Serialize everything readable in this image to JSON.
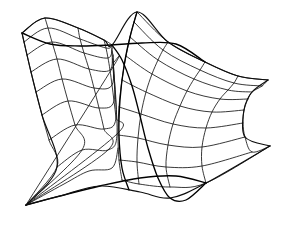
{
  "figure": {
    "title": "Self-intersecting ruled surface wireframe",
    "kind": "line-drawing",
    "background_color": "#ffffff",
    "line_color": "#151515",
    "width": 283,
    "height": 227
  },
  "chart_data": {
    "type": "line",
    "title": "Self-intersecting ruled surface wireframe",
    "xlabel": "",
    "ylabel": "",
    "grid": false,
    "legend": "none",
    "xlim": [
      0,
      283
    ],
    "ylim": [
      0,
      227
    ],
    "key_points": {
      "left_cone_apex": [
        26,
        205
      ],
      "left_top_corner": [
        22,
        33
      ],
      "left_top_ridge": [
        45,
        18
      ],
      "central_node": [
        112,
        45
      ],
      "central_peak": [
        137,
        12
      ],
      "right_upper_tip": [
        268,
        80
      ],
      "right_waist_upper": [
        248,
        90
      ],
      "right_waist_lower": [
        245,
        118
      ],
      "right_lower_tip": [
        270,
        146
      ],
      "bottom_fold_tail": [
        249,
        160
      ]
    },
    "series": [
      {
        "name": "left-sheet-u-curves",
        "values": [
          [
            [
              22,
              33
            ],
            [
              45,
              18
            ],
            [
              78,
              28
            ],
            [
              104,
              40
            ],
            [
              112,
              45
            ]
          ],
          [
            [
              24,
              42
            ],
            [
              48,
              28
            ],
            [
              80,
              39
            ],
            [
              106,
              48
            ],
            [
              112,
              46
            ]
          ],
          [
            [
              27,
              55
            ],
            [
              52,
              42
            ],
            [
              84,
              53
            ],
            [
              108,
              58
            ],
            [
              112,
              48
            ]
          ],
          [
            [
              31,
              72
            ],
            [
              57,
              59
            ],
            [
              89,
              69
            ],
            [
              110,
              70
            ],
            [
              112,
              51
            ]
          ],
          [
            [
              36,
              92
            ],
            [
              62,
              79
            ],
            [
              94,
              88
            ],
            [
              112,
              85
            ],
            [
              113,
              55
            ]
          ],
          [
            [
              42,
              115
            ],
            [
              68,
              101
            ],
            [
              99,
              108
            ],
            [
              114,
              101
            ],
            [
              113,
              59
            ]
          ],
          [
            [
              49,
              140
            ],
            [
              75,
              125
            ],
            [
              104,
              129
            ],
            [
              116,
              118
            ],
            [
              113,
              63
            ]
          ],
          [
            [
              57,
              167
            ],
            [
              82,
              150
            ],
            [
              108,
              150
            ],
            [
              117,
              134
            ],
            [
              113,
              67
            ]
          ],
          [
            [
              26,
              205
            ],
            [
              64,
              184
            ],
            [
              89,
              171
            ],
            [
              112,
              168
            ],
            [
              118,
              148
            ]
          ]
        ]
      },
      {
        "name": "left-sheet-v-curves",
        "values": [
          [
            [
              22,
              33
            ],
            [
              24,
              42
            ],
            [
              27,
              55
            ],
            [
              31,
              72
            ],
            [
              36,
              92
            ],
            [
              42,
              115
            ],
            [
              49,
              140
            ],
            [
              57,
              167
            ],
            [
              26,
              205
            ]
          ],
          [
            [
              45,
              18
            ],
            [
              48,
              28
            ],
            [
              52,
              42
            ],
            [
              57,
              59
            ],
            [
              62,
              79
            ],
            [
              68,
              101
            ],
            [
              75,
              125
            ],
            [
              82,
              150
            ],
            [
              26,
              205
            ]
          ],
          [
            [
              78,
              28
            ],
            [
              80,
              39
            ],
            [
              84,
              53
            ],
            [
              89,
              69
            ],
            [
              94,
              88
            ],
            [
              99,
              108
            ],
            [
              104,
              129
            ],
            [
              108,
              150
            ],
            [
              26,
              205
            ]
          ],
          [
            [
              104,
              40
            ],
            [
              106,
              48
            ],
            [
              108,
              58
            ],
            [
              110,
              70
            ],
            [
              112,
              85
            ],
            [
              114,
              101
            ],
            [
              116,
              118
            ],
            [
              117,
              134
            ],
            [
              26,
              205
            ]
          ],
          [
            [
              112,
              45
            ],
            [
              112,
              46
            ],
            [
              112,
              48
            ],
            [
              112,
              51
            ],
            [
              113,
              55
            ],
            [
              113,
              59
            ],
            [
              113,
              63
            ],
            [
              113,
              67
            ],
            [
              26,
              205
            ]
          ]
        ]
      },
      {
        "name": "right-sheet-u-curves",
        "values": [
          [
            [
              137,
              12
            ],
            [
              168,
              42
            ],
            [
              205,
              62
            ],
            [
              238,
              76
            ],
            [
              268,
              80
            ]
          ],
          [
            [
              134,
              22
            ],
            [
              163,
              50
            ],
            [
              200,
              70
            ],
            [
              234,
              83
            ],
            [
              262,
              86
            ]
          ],
          [
            [
              130,
              37
            ],
            [
              158,
              60
            ],
            [
              194,
              79
            ],
            [
              228,
              90
            ],
            [
              252,
              92
            ]
          ],
          [
            [
              126,
              56
            ],
            [
              152,
              74
            ],
            [
              187,
              91
            ],
            [
              220,
              99
            ],
            [
              248,
              99
            ]
          ],
          [
            [
              122,
              80
            ],
            [
              146,
              92
            ],
            [
              180,
              106
            ],
            [
              212,
              112
            ],
            [
              244,
              110
            ]
          ],
          [
            [
              119,
              107
            ],
            [
              141,
              114
            ],
            [
              173,
              124
            ],
            [
              206,
              128
            ],
            [
              243,
              123
            ]
          ],
          [
            [
              118,
              135
            ],
            [
              138,
              138
            ],
            [
              168,
              145
            ],
            [
              202,
              147
            ],
            [
              245,
              137
            ]
          ],
          [
            [
              119,
              160
            ],
            [
              137,
              162
            ],
            [
              166,
              167
            ],
            [
              202,
              166
            ],
            [
              252,
              152
            ]
          ],
          [
            [
              122,
              180
            ],
            [
              139,
              184
            ],
            [
              170,
              187
            ],
            [
              206,
              183
            ],
            [
              270,
              146
            ]
          ]
        ]
      },
      {
        "name": "right-sheet-v-curves",
        "values": [
          [
            [
              137,
              12
            ],
            [
              134,
              22
            ],
            [
              130,
              37
            ],
            [
              126,
              56
            ],
            [
              122,
              80
            ],
            [
              119,
              107
            ],
            [
              118,
              135
            ],
            [
              119,
              160
            ],
            [
              122,
              180
            ]
          ],
          [
            [
              168,
              42
            ],
            [
              163,
              50
            ],
            [
              158,
              60
            ],
            [
              152,
              74
            ],
            [
              146,
              92
            ],
            [
              141,
              114
            ],
            [
              138,
              138
            ],
            [
              137,
              162
            ],
            [
              139,
              184
            ]
          ],
          [
            [
              205,
              62
            ],
            [
              200,
              70
            ],
            [
              194,
              79
            ],
            [
              187,
              91
            ],
            [
              180,
              106
            ],
            [
              173,
              124
            ],
            [
              168,
              145
            ],
            [
              166,
              167
            ],
            [
              170,
              187
            ]
          ],
          [
            [
              238,
              76
            ],
            [
              234,
              83
            ],
            [
              228,
              90
            ],
            [
              220,
              99
            ],
            [
              212,
              112
            ],
            [
              206,
              128
            ],
            [
              202,
              147
            ],
            [
              202,
              166
            ],
            [
              206,
              183
            ]
          ],
          [
            [
              268,
              80
            ],
            [
              262,
              86
            ],
            [
              252,
              92
            ],
            [
              248,
              99
            ],
            [
              244,
              110
            ],
            [
              243,
              123
            ],
            [
              245,
              137
            ],
            [
              252,
              152
            ],
            [
              270,
              146
            ]
          ]
        ]
      },
      {
        "name": "fold-creases",
        "values": [
          [
            [
              112,
              45
            ],
            [
              122,
              60
            ],
            [
              132,
              86
            ],
            [
              140,
              116
            ],
            [
              148,
              148
            ],
            [
              158,
              178
            ],
            [
              170,
              198
            ],
            [
              186,
              200
            ],
            [
              206,
              183
            ]
          ],
          [
            [
              137,
              12
            ],
            [
              130,
              37
            ],
            [
              124,
              66
            ],
            [
              120,
              100
            ],
            [
              119,
              135
            ],
            [
              122,
              168
            ],
            [
              129,
              190
            ]
          ],
          [
            [
              26,
              205
            ],
            [
              60,
              196
            ],
            [
              100,
              186
            ],
            [
              140,
              178
            ],
            [
              176,
              176
            ],
            [
              206,
              183
            ]
          ],
          [
            [
              112,
              45
            ],
            [
              80,
              46
            ],
            [
              50,
              44
            ],
            [
              22,
              33
            ]
          ],
          [
            [
              112,
              45
            ],
            [
              142,
              43
            ],
            [
              176,
              44
            ],
            [
              205,
              62
            ]
          ]
        ]
      },
      {
        "name": "outline-silhouette",
        "values": [
          [
            [
              22,
              33
            ],
            [
              45,
              18
            ],
            [
              78,
              28
            ],
            [
              104,
              40
            ],
            [
              112,
              45
            ],
            [
              137,
              12
            ],
            [
              168,
              42
            ],
            [
              205,
              62
            ],
            [
              238,
              76
            ],
            [
              268,
              80
            ]
          ],
          [
            [
              268,
              80
            ],
            [
              252,
              92
            ],
            [
              244,
              110
            ],
            [
              245,
              137
            ],
            [
              270,
              146
            ]
          ],
          [
            [
              270,
              146
            ],
            [
              206,
              183
            ],
            [
              170,
              198
            ],
            [
              140,
              192
            ],
            [
              100,
              186
            ],
            [
              60,
              196
            ],
            [
              26,
              205
            ]
          ],
          [
            [
              26,
              205
            ],
            [
              57,
              167
            ],
            [
              42,
              115
            ],
            [
              31,
              72
            ],
            [
              22,
              33
            ]
          ]
        ]
      }
    ]
  }
}
